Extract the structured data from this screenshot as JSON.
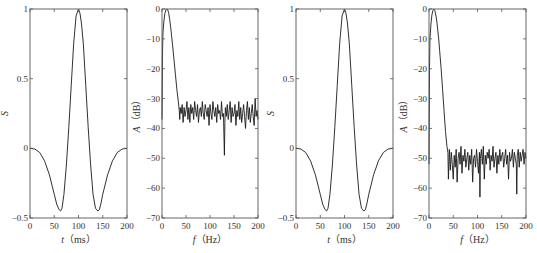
{
  "chart_data": [
    {
      "id": "wavelet-1",
      "type": "line",
      "title": "",
      "xlabel": "t（ms）",
      "xlabel_italic_part": "t",
      "xlabel_unit": "（ms）",
      "ylabel": "S",
      "xlim": [
        0,
        200
      ],
      "ylim": [
        -0.5,
        1
      ],
      "xticks": [
        0,
        50,
        100,
        150,
        200
      ],
      "xtick_labels": [
        "0",
        "50",
        "100",
        "150",
        "200"
      ],
      "yticks": [
        -0.5,
        0,
        0.5,
        1
      ],
      "ytick_labels": [
        "−0.5",
        "0",
        "0.5",
        "1"
      ],
      "grid": false,
      "frame_px": {
        "left": 30,
        "right": 127,
        "top": 9,
        "bottom": 218
      },
      "series": [
        {
          "name": "wavelet",
          "x": [
            0,
            10,
            20,
            30,
            40,
            50,
            55,
            60,
            63,
            66,
            70,
            75,
            80,
            85,
            90,
            95,
            100,
            103,
            106,
            110,
            115,
            120,
            125,
            130,
            135,
            140,
            143,
            146,
            150,
            160,
            170,
            180,
            190,
            200
          ],
          "y": [
            0,
            -0.005,
            -0.03,
            -0.09,
            -0.19,
            -0.33,
            -0.4,
            -0.44,
            -0.45,
            -0.43,
            -0.33,
            -0.12,
            0.15,
            0.45,
            0.75,
            0.95,
            1.0,
            0.97,
            0.9,
            0.75,
            0.45,
            0.15,
            -0.12,
            -0.33,
            -0.43,
            -0.45,
            -0.44,
            -0.4,
            -0.33,
            -0.19,
            -0.09,
            -0.03,
            -0.005,
            0
          ]
        }
      ]
    },
    {
      "id": "spectrum-1",
      "type": "line",
      "title": "",
      "xlabel": "f（Hz）",
      "xlabel_italic_part": "f",
      "xlabel_unit": "（Hz）",
      "ylabel": "A（dB）",
      "ylabel_italic_part": "A",
      "ylabel_unit": "（dB）",
      "xlim": [
        0,
        200
      ],
      "ylim": [
        -70,
        0
      ],
      "xticks": [
        0,
        50,
        100,
        150,
        200
      ],
      "xtick_labels": [
        "0",
        "50",
        "100",
        "150",
        "200"
      ],
      "yticks": [
        -70,
        -60,
        -50,
        -40,
        -30,
        -20,
        -10,
        0
      ],
      "ytick_labels": [
        "−70",
        "−60",
        "−50",
        "−40",
        "−30",
        "−20",
        "−10",
        "0"
      ],
      "grid": false,
      "frame_px": {
        "left": 162,
        "right": 258,
        "top": 9,
        "bottom": 218
      },
      "noise_floor_db": -35,
      "notable_dip": {
        "x": 130,
        "y": -49
      },
      "series": [
        {
          "name": "amplitude-spectrum",
          "x": [
            0,
            1,
            2,
            4,
            6,
            8,
            10,
            12,
            14,
            16,
            18,
            20,
            22,
            25,
            28,
            31,
            34,
            36,
            37,
            38,
            40,
            42,
            44,
            46,
            48,
            50,
            52,
            54,
            56,
            58,
            60,
            62,
            64,
            66,
            68,
            70,
            72,
            74,
            76,
            78,
            80,
            82,
            84,
            86,
            88,
            90,
            92,
            94,
            96,
            98,
            100,
            102,
            104,
            106,
            108,
            110,
            112,
            114,
            116,
            118,
            120,
            122,
            124,
            126,
            128,
            129,
            130,
            131,
            132,
            134,
            136,
            138,
            140,
            142,
            144,
            146,
            148,
            150,
            152,
            154,
            156,
            158,
            160,
            162,
            164,
            166,
            168,
            170,
            172,
            174,
            176,
            178,
            180,
            182,
            184,
            186,
            188,
            190,
            192,
            194,
            196,
            198,
            200
          ],
          "y": [
            -37,
            -15,
            -8,
            -4,
            -1.5,
            -0.3,
            0,
            -0.3,
            -1.5,
            -3.5,
            -6,
            -9,
            -12,
            -17,
            -22,
            -27,
            -31,
            -34,
            -37,
            -33,
            -35,
            -32,
            -38,
            -33,
            -36,
            -34,
            -31,
            -37,
            -33,
            -38,
            -32,
            -35,
            -33,
            -37,
            -31,
            -34,
            -36,
            -32,
            -38,
            -34,
            -33,
            -36,
            -31,
            -35,
            -37,
            -32,
            -34,
            -36,
            -33,
            -39,
            -32,
            -35,
            -37,
            -31,
            -34,
            -36,
            -33,
            -38,
            -32,
            -35,
            -34,
            -37,
            -31,
            -36,
            -35,
            -42,
            -49,
            -38,
            -33,
            -36,
            -32,
            -37,
            -34,
            -31,
            -38,
            -33,
            -36,
            -35,
            -32,
            -39,
            -34,
            -36,
            -31,
            -37,
            -33,
            -38,
            -35,
            -32,
            -36,
            -40,
            -34,
            -31,
            -37,
            -33,
            -38,
            -35,
            -32,
            -36,
            -39,
            -30,
            -36,
            -34,
            -37
          ]
        }
      ]
    },
    {
      "id": "wavelet-2",
      "type": "line",
      "title": "",
      "xlabel": "t（ms）",
      "xlabel_italic_part": "t",
      "xlabel_unit": "（ms）",
      "ylabel": "S",
      "xlim": [
        0,
        200
      ],
      "ylim": [
        -0.5,
        1
      ],
      "xticks": [
        0,
        50,
        100,
        150,
        200
      ],
      "xtick_labels": [
        "0",
        "50",
        "100",
        "150",
        "200"
      ],
      "yticks": [
        -0.5,
        0,
        0.5,
        1
      ],
      "ytick_labels": [
        "−0.5",
        "0",
        "0.5",
        "1"
      ],
      "grid": false,
      "frame_px": {
        "left": 296,
        "right": 393,
        "top": 9,
        "bottom": 218
      },
      "series": [
        {
          "name": "wavelet",
          "x": [
            0,
            10,
            20,
            30,
            40,
            50,
            55,
            60,
            63,
            66,
            70,
            75,
            80,
            85,
            90,
            95,
            100,
            103,
            106,
            110,
            115,
            120,
            125,
            130,
            135,
            140,
            143,
            146,
            150,
            160,
            170,
            180,
            190,
            200
          ],
          "y": [
            0,
            -0.005,
            -0.03,
            -0.09,
            -0.19,
            -0.33,
            -0.4,
            -0.44,
            -0.45,
            -0.43,
            -0.33,
            -0.12,
            0.15,
            0.45,
            0.75,
            0.95,
            1.0,
            0.97,
            0.9,
            0.75,
            0.45,
            0.15,
            -0.12,
            -0.33,
            -0.43,
            -0.45,
            -0.44,
            -0.4,
            -0.33,
            -0.19,
            -0.09,
            -0.03,
            -0.005,
            0
          ]
        }
      ]
    },
    {
      "id": "spectrum-2",
      "type": "line",
      "title": "",
      "xlabel": "f（Hz）",
      "xlabel_italic_part": "f",
      "xlabel_unit": "（Hz）",
      "ylabel": "A（dB）",
      "ylabel_italic_part": "A",
      "ylabel_unit": "（dB）",
      "xlim": [
        0,
        200
      ],
      "ylim": [
        -70,
        0
      ],
      "xticks": [
        0,
        50,
        100,
        150,
        200
      ],
      "xtick_labels": [
        "0",
        "50",
        "100",
        "150",
        "200"
      ],
      "yticks": [
        -70,
        -60,
        -50,
        -40,
        -30,
        -20,
        -10,
        0
      ],
      "ytick_labels": [
        "−70",
        "−60",
        "−50",
        "−40",
        "−30",
        "−20",
        "−10",
        "0"
      ],
      "grid": false,
      "frame_px": {
        "left": 429,
        "right": 526,
        "top": 9,
        "bottom": 218
      },
      "noise_floor_db": -50,
      "notable_dip": {
        "x": 105,
        "y": -63
      },
      "series": [
        {
          "name": "amplitude-spectrum",
          "x": [
            0,
            1,
            2,
            4,
            6,
            8,
            10,
            12,
            14,
            16,
            18,
            20,
            22,
            25,
            28,
            31,
            34,
            37,
            39,
            40,
            42,
            44,
            46,
            48,
            50,
            52,
            54,
            56,
            58,
            60,
            62,
            64,
            66,
            68,
            70,
            72,
            74,
            76,
            78,
            80,
            82,
            84,
            86,
            88,
            90,
            92,
            94,
            96,
            98,
            100,
            102,
            104,
            105,
            106,
            108,
            110,
            112,
            114,
            116,
            118,
            120,
            122,
            124,
            126,
            128,
            130,
            132,
            134,
            136,
            138,
            140,
            142,
            144,
            146,
            148,
            150,
            152,
            154,
            156,
            158,
            160,
            162,
            164,
            166,
            168,
            170,
            172,
            174,
            176,
            178,
            180,
            181,
            182,
            184,
            186,
            188,
            190,
            192,
            194,
            196,
            198,
            200
          ],
          "y": [
            -52,
            -20,
            -10,
            -5,
            -2,
            -0.5,
            0,
            -0.5,
            -2,
            -4,
            -7,
            -10,
            -14,
            -20,
            -27,
            -34,
            -41,
            -46,
            -48,
            -57,
            -47,
            -54,
            -48,
            -52,
            -57,
            -49,
            -53,
            -47,
            -58,
            -50,
            -48,
            -52,
            -46,
            -55,
            -49,
            -51,
            -47,
            -53,
            -50,
            -48,
            -54,
            -49,
            -52,
            -47,
            -58,
            -50,
            -49,
            -53,
            -47,
            -51,
            -55,
            -48,
            -63,
            -50,
            -47,
            -52,
            -46,
            -57,
            -49,
            -52,
            -48,
            -50,
            -47,
            -54,
            -49,
            -51,
            -46,
            -53,
            -50,
            -48,
            -55,
            -49,
            -52,
            -47,
            -51,
            -49,
            -48,
            -53,
            -50,
            -47,
            -52,
            -49,
            -57,
            -48,
            -51,
            -50,
            -47,
            -53,
            -48,
            -50,
            -52,
            -62,
            -49,
            -47,
            -53,
            -48,
            -51,
            -49,
            -47,
            -52,
            -48,
            -50
          ]
        }
      ]
    }
  ]
}
